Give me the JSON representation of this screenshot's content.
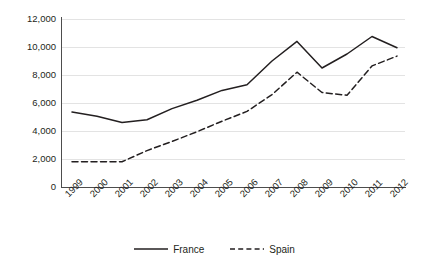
{
  "chart_data": {
    "type": "line",
    "title": "",
    "subtitle": "",
    "xlabel": "",
    "ylabel": "",
    "categories": [
      "1999",
      "2000",
      "2001",
      "2002",
      "2003",
      "2004",
      "2005",
      "2006",
      "2007",
      "2008",
      "2009",
      "2010",
      "2011",
      "2012"
    ],
    "ylim": [
      0,
      12000
    ],
    "yticks": [
      0,
      2000,
      4000,
      6000,
      8000,
      10000,
      12000
    ],
    "ytick_labels": [
      "0",
      "2,000",
      "4,000",
      "6,000",
      "8,000",
      "10,000",
      "12,000"
    ],
    "grid": true,
    "grid_axis": "y",
    "legend_position": "bottom",
    "series": [
      {
        "name": "France",
        "style": "solid",
        "color": "#231f20",
        "values": [
          5350,
          5050,
          4600,
          4800,
          5600,
          6200,
          6900,
          7300,
          9000,
          10400,
          8500,
          9500,
          10750,
          9950
        ]
      },
      {
        "name": "Spain",
        "style": "dashed",
        "color": "#231f20",
        "values": [
          1800,
          1800,
          1800,
          2600,
          3250,
          3950,
          4700,
          5400,
          6600,
          8200,
          6750,
          6550,
          8650,
          9350
        ]
      }
    ]
  },
  "legend": {
    "entries": [
      {
        "label": "France",
        "icon": "solid-line-icon"
      },
      {
        "label": "Spain",
        "icon": "dashed-line-icon"
      }
    ]
  },
  "colors": {
    "line": "#231f20",
    "grid": "#e3e3e3",
    "axis": "#4d4d4d",
    "background": "#ffffff",
    "text": "#231f20"
  }
}
